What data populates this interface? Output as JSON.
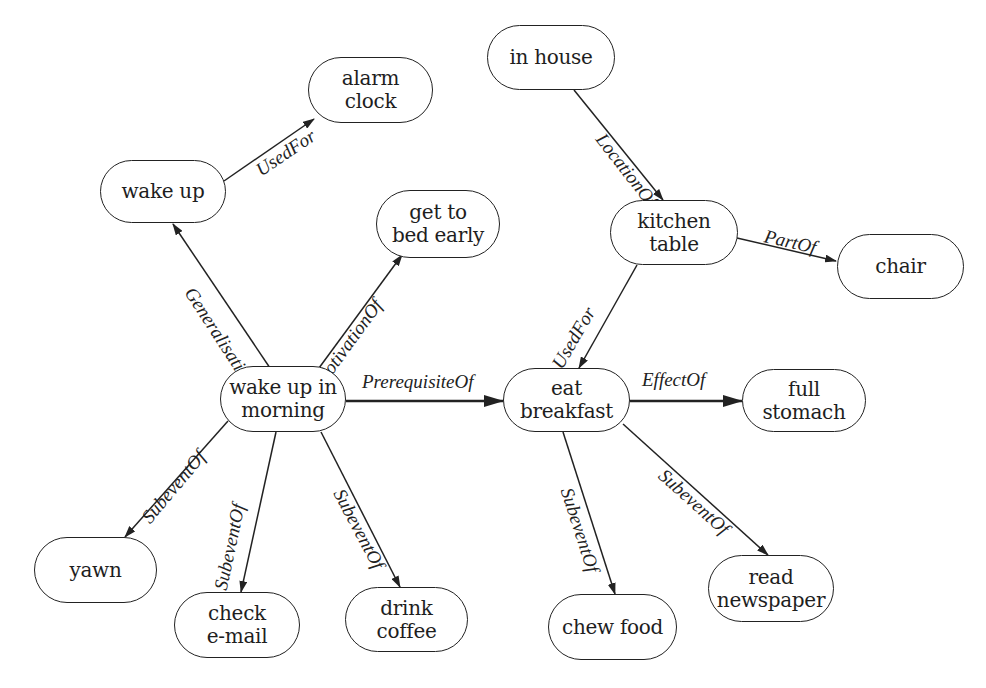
{
  "diagram": {
    "type": "concept-graph",
    "colors": {
      "stroke": "#222222",
      "text": "#1e1e1e",
      "background": "#ffffff"
    },
    "nodes": [
      {
        "id": "wake_up",
        "label": "wake up",
        "x": 100,
        "y": 160,
        "w": 126,
        "h": 63
      },
      {
        "id": "alarm_clock",
        "label": "alarm\nclock",
        "x": 308,
        "y": 57,
        "w": 125,
        "h": 66
      },
      {
        "id": "get_to_bed_early",
        "label": "get to\nbed early",
        "x": 376,
        "y": 190,
        "w": 124,
        "h": 68
      },
      {
        "id": "in_house",
        "label": "in house",
        "x": 487,
        "y": 25,
        "w": 128,
        "h": 65
      },
      {
        "id": "kitchen_table",
        "label": "kitchen\ntable",
        "x": 610,
        "y": 200,
        "w": 128,
        "h": 65
      },
      {
        "id": "chair",
        "label": "chair",
        "x": 837,
        "y": 234,
        "w": 127,
        "h": 65
      },
      {
        "id": "wake_up_in_morning",
        "label": "wake up in\nmorning",
        "x": 220,
        "y": 366,
        "w": 126,
        "h": 66
      },
      {
        "id": "eat_breakfast",
        "label": "eat\nbreakfast",
        "x": 503,
        "y": 368,
        "w": 127,
        "h": 64
      },
      {
        "id": "full_stomach",
        "label": "full\nstomach",
        "x": 742,
        "y": 369,
        "w": 124,
        "h": 63
      },
      {
        "id": "yawn",
        "label": "yawn",
        "x": 34,
        "y": 537,
        "w": 123,
        "h": 66
      },
      {
        "id": "check_email",
        "label": "check\ne-mail",
        "x": 174,
        "y": 592,
        "w": 126,
        "h": 66
      },
      {
        "id": "drink_coffee",
        "label": "drink\ncoffee",
        "x": 345,
        "y": 587,
        "w": 123,
        "h": 65
      },
      {
        "id": "chew_food",
        "label": "chew food",
        "x": 548,
        "y": 594,
        "w": 129,
        "h": 66
      },
      {
        "id": "read_newspaper",
        "label": "read\nnewspaper",
        "x": 708,
        "y": 555,
        "w": 126,
        "h": 67
      }
    ],
    "edges": [
      {
        "from": "wake_up",
        "to": "alarm_clock",
        "label": "UsedFor",
        "x1": 224,
        "y1": 181,
        "x2": 314,
        "y2": 119,
        "lx": 252,
        "ly": 126,
        "angle": -34,
        "bold": false
      },
      {
        "from": "wake_up_in_morning",
        "to": "wake_up",
        "label": "Generalisation",
        "x1": 270,
        "y1": 368,
        "x2": 173,
        "y2": 224,
        "lx": 181,
        "ly": 284,
        "angle": 57,
        "bold": false
      },
      {
        "from": "wake_up_in_morning",
        "to": "get_to_bed_early",
        "label": "MotivationOf",
        "x1": 319,
        "y1": 368,
        "x2": 402,
        "y2": 255,
        "lx": 310,
        "ly": 296,
        "angle": -54,
        "bold": false
      },
      {
        "from": "in_house",
        "to": "kitchen_table",
        "label": "LocationOf",
        "x1": 574,
        "y1": 90,
        "x2": 663,
        "y2": 200,
        "lx": 592,
        "ly": 130,
        "angle": 52,
        "bold": false
      },
      {
        "from": "kitchen_table",
        "to": "chair",
        "label": "PartOf",
        "x1": 737,
        "y1": 238,
        "x2": 836,
        "y2": 261,
        "lx": 762,
        "ly": 226,
        "angle": 13,
        "bold": false
      },
      {
        "from": "kitchen_table",
        "to": "eat_breakfast",
        "label": "UsedFor",
        "x1": 637,
        "y1": 265,
        "x2": 579,
        "y2": 368,
        "lx": 548,
        "ly": 304,
        "angle": -60,
        "bold": false
      },
      {
        "from": "wake_up_in_morning",
        "to": "eat_breakfast",
        "label": "PrerequisiteOf",
        "x1": 346,
        "y1": 401,
        "x2": 503,
        "y2": 401,
        "lx": 362,
        "ly": 372,
        "angle": 0,
        "bold": true
      },
      {
        "from": "eat_breakfast",
        "to": "full_stomach",
        "label": "EffectOf",
        "x1": 630,
        "y1": 401,
        "x2": 742,
        "y2": 401,
        "lx": 642,
        "ly": 370,
        "angle": 0,
        "bold": true
      },
      {
        "from": "wake_up_in_morning",
        "to": "yawn",
        "label": "SubeventOf",
        "x1": 228,
        "y1": 421,
        "x2": 125,
        "y2": 537,
        "lx": 138,
        "ly": 447,
        "angle": -50,
        "bold": false
      },
      {
        "from": "wake_up_in_morning",
        "to": "check_email",
        "label": "SubeventOf",
        "x1": 276,
        "y1": 432,
        "x2": 241,
        "y2": 592,
        "lx": 211,
        "ly": 502,
        "angle": -78,
        "bold": false
      },
      {
        "from": "wake_up_in_morning",
        "to": "drink_coffee",
        "label": "SubeventOf",
        "x1": 321,
        "y1": 432,
        "x2": 400,
        "y2": 587,
        "lx": 330,
        "ly": 485,
        "angle": 62,
        "bold": false
      },
      {
        "from": "eat_breakfast",
        "to": "chew_food",
        "label": "SubeventOf",
        "x1": 563,
        "y1": 432,
        "x2": 615,
        "y2": 594,
        "lx": 557,
        "ly": 485,
        "angle": 72,
        "bold": false
      },
      {
        "from": "eat_breakfast",
        "to": "read_newspaper",
        "label": "SubeventOf",
        "x1": 623,
        "y1": 424,
        "x2": 768,
        "y2": 555,
        "lx": 655,
        "ly": 465,
        "angle": 42,
        "bold": false
      }
    ]
  }
}
